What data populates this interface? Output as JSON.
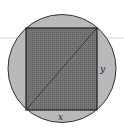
{
  "figure": {
    "labels": {
      "bottom_side": "x",
      "right_side": "y"
    },
    "colors": {
      "circle_fill": "#b9b9b9",
      "circle_stroke": "#333333",
      "rect_fill": "#6e6e6e",
      "rect_stroke": "#1e1e1e",
      "diagonal": "#1e1e1e",
      "guide_line": "#d8d8d8"
    }
  }
}
